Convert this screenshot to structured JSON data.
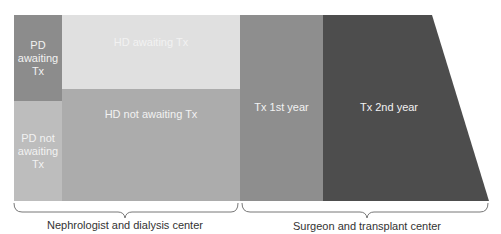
{
  "diagram": {
    "blocks": {
      "pd_awaiting": {
        "label_lines": [
          "PD",
          "awaiting",
          "Tx"
        ],
        "color": "#8c8c8c"
      },
      "pd_not_awaiting": {
        "label_lines": [
          "PD not",
          "awaiting",
          "Tx"
        ],
        "color": "#bdbdbd"
      },
      "hd_awaiting": {
        "label": "HD awaiting Tx",
        "color": "#e0e0e0"
      },
      "hd_not_awaiting": {
        "label": "HD not awaiting Tx",
        "color": "#acacac"
      },
      "tx_1st_year": {
        "label": "Tx 1st year",
        "color": "#8e8e8e"
      },
      "tx_2nd_year": {
        "label": "Tx 2nd year",
        "color": "#4d4d4d"
      }
    },
    "groups": [
      {
        "label": "Nephrologist and dialysis center"
      },
      {
        "label": "Surgeon and transplant center"
      }
    ]
  }
}
